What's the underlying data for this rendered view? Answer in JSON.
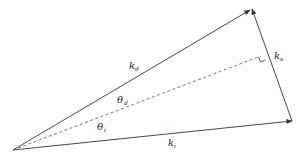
{
  "diagram": {
    "title": "",
    "vectors": [
      {
        "id": "k_d",
        "label": "k",
        "subscript": "d",
        "from": [
          13,
          150
        ],
        "to": [
          250,
          10
        ],
        "style": "solid-arrow"
      },
      {
        "id": "k_i",
        "label": "k",
        "subscript": "i",
        "from": [
          13,
          150
        ],
        "to": [
          292,
          121
        ],
        "style": "solid-arrow"
      },
      {
        "id": "k_s",
        "label": "k",
        "subscript": "s",
        "from": [
          292,
          121
        ],
        "to": [
          252,
          8
        ],
        "style": "solid-arrow"
      },
      {
        "id": "bisector",
        "label": "",
        "from": [
          13,
          150
        ],
        "to": [
          263,
          55
        ],
        "style": "dashed"
      }
    ],
    "angles": [
      {
        "id": "theta_d",
        "label": "θ",
        "subscript": "d"
      },
      {
        "id": "theta_i",
        "label": "θ",
        "subscript": "i"
      }
    ],
    "markers": [
      {
        "type": "right-angle",
        "at": [
          263,
          55
        ]
      }
    ],
    "labels": {
      "k_d": {
        "main": "k",
        "sub": "d"
      },
      "k_i": {
        "main": "k",
        "sub": "i"
      },
      "k_s": {
        "main": "k",
        "sub": "s"
      },
      "theta_d": {
        "main": "θ",
        "sub": "d"
      },
      "theta_i": {
        "main": "θ",
        "sub": "i"
      }
    },
    "colors": {
      "line": "#333333",
      "background": "#ffffff"
    }
  }
}
